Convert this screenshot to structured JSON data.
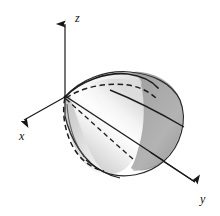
{
  "figure": {
    "background_color": "#ffffff",
    "width": 220,
    "height": 216
  },
  "axes": {
    "origin": {
      "x": 65,
      "y": 97
    },
    "line_color": "#1a1a1a",
    "items": [
      {
        "name": "z",
        "label": "z",
        "label_x": 75,
        "label_y": 22,
        "tip_x": 65,
        "tip_y": 16,
        "direction": "up"
      },
      {
        "name": "x",
        "label": "x",
        "label_x": 19,
        "label_y": 140,
        "tip_x": 17,
        "tip_y": 124,
        "direction": "down-left"
      },
      {
        "name": "y",
        "label": "y",
        "label_x": 200,
        "label_y": 203,
        "tip_x": 201,
        "tip_y": 187,
        "direction": "down-right"
      }
    ]
  },
  "solid": {
    "type": "elliptic-paraboloid",
    "opens_along": "+y",
    "vertex": {
      "x": 65,
      "y": 97
    },
    "cap_center": {
      "x": 158,
      "y": 122
    },
    "colors": {
      "highlight": "#fdfdfd",
      "light_gray": "#d2d2d2",
      "mid_gray": "#b4b4b4",
      "cap_gray": "#a6a6a6",
      "cap_shadow": "#8f8f8f",
      "outline": "#2b2b2b"
    },
    "curves": {
      "solid_rim_label": "visible trace",
      "dashed_label": "hidden trace",
      "ruling_label": "surface ruling line"
    }
  }
}
